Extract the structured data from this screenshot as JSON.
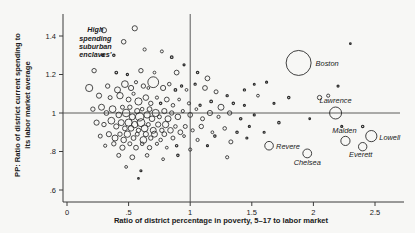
{
  "chart_data": {
    "type": "scatter",
    "title": "",
    "xlabel": "Ratio of district percentage in poverty, 5–17 to labor market",
    "ylabel": "PP: Ratio of district current spending to its labor market average",
    "xlim": [
      -0.05,
      2.75
    ],
    "ylim": [
      0.55,
      1.5
    ],
    "xticks": [
      0,
      0.5,
      1,
      1.5,
      2,
      2.5
    ],
    "xticklabels": [
      "0",
      ".5",
      "1",
      "1.5",
      "2",
      "2.5"
    ],
    "yticks": [
      0.6,
      0.8,
      1.0,
      1.2,
      1.4
    ],
    "yticklabels": [
      ".6",
      ".8",
      "1",
      "1.2",
      "1.4"
    ],
    "grid": false,
    "legend": null,
    "marker": "open-circle",
    "size_encoding": "district enrollment",
    "reference_lines": [
      {
        "type": "horizontal",
        "value": 1.0,
        "label": "y = 1"
      },
      {
        "type": "vertical",
        "value": 1.0,
        "label": "x = 1"
      }
    ],
    "annotations": [
      {
        "text": "High spending suburban enclaves'",
        "x": 0.23,
        "y": 1.42,
        "style": "italic"
      }
    ],
    "labeled_points": [
      {
        "name": "Boston",
        "x": 1.88,
        "y": 1.26,
        "r": 12.5
      },
      {
        "name": "Lawrence",
        "x": 2.18,
        "y": 1.0,
        "r": 6.0
      },
      {
        "name": "Malden",
        "x": 2.26,
        "y": 0.855,
        "r": 4.6
      },
      {
        "name": "Lowell",
        "x": 2.47,
        "y": 0.88,
        "r": 5.6
      },
      {
        "name": "Everett",
        "x": 2.4,
        "y": 0.825,
        "r": 4.2
      },
      {
        "name": "Revere",
        "x": 1.64,
        "y": 0.83,
        "r": 4.3
      },
      {
        "name": "Chelsea",
        "x": 1.95,
        "y": 0.79,
        "r": 4.4
      }
    ],
    "points": [
      {
        "x": 0.3,
        "y": 1.43,
        "r": 2.6
      },
      {
        "x": 0.55,
        "y": 1.44,
        "r": 2.6
      },
      {
        "x": 0.46,
        "y": 1.37,
        "r": 2.3
      },
      {
        "x": 0.63,
        "y": 1.33,
        "r": 1.6
      },
      {
        "x": 0.38,
        "y": 1.3,
        "r": 1.2
      },
      {
        "x": 0.29,
        "y": 1.3,
        "r": 1.2
      },
      {
        "x": 0.77,
        "y": 1.32,
        "r": 1.5
      },
      {
        "x": 0.85,
        "y": 1.29,
        "r": 1.3
      },
      {
        "x": 0.22,
        "y": 1.22,
        "r": 2.2
      },
      {
        "x": 0.4,
        "y": 1.21,
        "r": 1.3
      },
      {
        "x": 0.49,
        "y": 1.2,
        "r": 1.1
      },
      {
        "x": 0.6,
        "y": 1.22,
        "r": 2.2
      },
      {
        "x": 0.71,
        "y": 1.21,
        "r": 1.4
      },
      {
        "x": 0.89,
        "y": 1.21,
        "r": 2.4
      },
      {
        "x": 1.06,
        "y": 1.21,
        "r": 1.2
      },
      {
        "x": 0.95,
        "y": 1.25,
        "r": 1.0
      },
      {
        "x": 1.14,
        "y": 1.18,
        "r": 2.4
      },
      {
        "x": 0.18,
        "y": 1.13,
        "r": 3.6
      },
      {
        "x": 0.33,
        "y": 1.14,
        "r": 2.2
      },
      {
        "x": 0.41,
        "y": 1.12,
        "r": 3.0
      },
      {
        "x": 0.47,
        "y": 1.15,
        "r": 3.4
      },
      {
        "x": 0.52,
        "y": 1.13,
        "r": 2.6
      },
      {
        "x": 0.56,
        "y": 1.16,
        "r": 1.6
      },
      {
        "x": 0.62,
        "y": 1.14,
        "r": 2.2
      },
      {
        "x": 0.66,
        "y": 1.13,
        "r": 1.4
      },
      {
        "x": 0.7,
        "y": 1.16,
        "r": 5.4
      },
      {
        "x": 0.78,
        "y": 1.13,
        "r": 2.6
      },
      {
        "x": 0.83,
        "y": 1.15,
        "r": 1.8
      },
      {
        "x": 0.88,
        "y": 1.12,
        "r": 1.3
      },
      {
        "x": 0.93,
        "y": 1.14,
        "r": 1.1
      },
      {
        "x": 0.97,
        "y": 1.12,
        "r": 1.4
      },
      {
        "x": 1.04,
        "y": 1.15,
        "r": 1.1
      },
      {
        "x": 1.12,
        "y": 1.13,
        "r": 2.4
      },
      {
        "x": 1.21,
        "y": 1.11,
        "r": 2.0
      },
      {
        "x": 1.3,
        "y": 1.09,
        "r": 1.1
      },
      {
        "x": 0.26,
        "y": 1.09,
        "r": 2.6
      },
      {
        "x": 0.35,
        "y": 1.08,
        "r": 2.0
      },
      {
        "x": 0.43,
        "y": 1.09,
        "r": 3.2
      },
      {
        "x": 0.5,
        "y": 1.07,
        "r": 2.4
      },
      {
        "x": 0.54,
        "y": 1.1,
        "r": 1.6
      },
      {
        "x": 0.58,
        "y": 1.06,
        "r": 3.6
      },
      {
        "x": 0.64,
        "y": 1.08,
        "r": 2.8
      },
      {
        "x": 0.68,
        "y": 1.05,
        "r": 2.2
      },
      {
        "x": 0.73,
        "y": 1.08,
        "r": 1.6
      },
      {
        "x": 0.76,
        "y": 1.05,
        "r": 1.2
      },
      {
        "x": 0.81,
        "y": 1.07,
        "r": 2.4
      },
      {
        "x": 0.86,
        "y": 1.04,
        "r": 1.8
      },
      {
        "x": 0.91,
        "y": 1.07,
        "r": 1.4
      },
      {
        "x": 0.99,
        "y": 1.05,
        "r": 1.6
      },
      {
        "x": 1.08,
        "y": 1.04,
        "r": 1.1
      },
      {
        "x": 1.17,
        "y": 1.06,
        "r": 1.3
      },
      {
        "x": 1.25,
        "y": 1.03,
        "r": 3.0
      },
      {
        "x": 1.35,
        "y": 1.05,
        "r": 1.2
      },
      {
        "x": 1.44,
        "y": 1.04,
        "r": 1.0
      },
      {
        "x": 0.21,
        "y": 1.02,
        "r": 2.2
      },
      {
        "x": 0.28,
        "y": 1.03,
        "r": 3.0
      },
      {
        "x": 0.32,
        "y": 1.0,
        "r": 2.4
      },
      {
        "x": 0.37,
        "y": 1.02,
        "r": 3.4
      },
      {
        "x": 0.42,
        "y": 0.99,
        "r": 2.8
      },
      {
        "x": 0.45,
        "y": 1.03,
        "r": 2.0
      },
      {
        "x": 0.48,
        "y": 1.0,
        "r": 3.8
      },
      {
        "x": 0.51,
        "y": 1.03,
        "r": 2.2
      },
      {
        "x": 0.53,
        "y": 0.98,
        "r": 3.0
      },
      {
        "x": 0.57,
        "y": 1.01,
        "r": 2.6
      },
      {
        "x": 0.59,
        "y": 0.98,
        "r": 4.2
      },
      {
        "x": 0.61,
        "y": 1.02,
        "r": 1.8
      },
      {
        "x": 0.65,
        "y": 0.99,
        "r": 3.2
      },
      {
        "x": 0.67,
        "y": 1.02,
        "r": 2.4
      },
      {
        "x": 0.69,
        "y": 0.97,
        "r": 2.8
      },
      {
        "x": 0.72,
        "y": 1.0,
        "r": 3.6
      },
      {
        "x": 0.75,
        "y": 0.98,
        "r": 2.0
      },
      {
        "x": 0.79,
        "y": 1.01,
        "r": 2.6
      },
      {
        "x": 0.82,
        "y": 0.97,
        "r": 3.0
      },
      {
        "x": 0.85,
        "y": 1.0,
        "r": 2.2
      },
      {
        "x": 0.9,
        "y": 0.98,
        "r": 2.8
      },
      {
        "x": 0.94,
        "y": 1.01,
        "r": 1.6
      },
      {
        "x": 1.0,
        "y": 0.99,
        "r": 2.4
      },
      {
        "x": 1.05,
        "y": 1.02,
        "r": 1.4
      },
      {
        "x": 1.1,
        "y": 0.97,
        "r": 2.0
      },
      {
        "x": 1.16,
        "y": 1.0,
        "r": 2.6
      },
      {
        "x": 1.23,
        "y": 0.98,
        "r": 1.6
      },
      {
        "x": 1.32,
        "y": 1.0,
        "r": 2.2
      },
      {
        "x": 1.41,
        "y": 0.97,
        "r": 1.2
      },
      {
        "x": 1.52,
        "y": 0.99,
        "r": 1.0
      },
      {
        "x": 0.24,
        "y": 0.95,
        "r": 2.6
      },
      {
        "x": 0.3,
        "y": 0.94,
        "r": 2.2
      },
      {
        "x": 0.36,
        "y": 0.96,
        "r": 3.4
      },
      {
        "x": 0.4,
        "y": 0.93,
        "r": 2.6
      },
      {
        "x": 0.44,
        "y": 0.95,
        "r": 3.0
      },
      {
        "x": 0.47,
        "y": 0.92,
        "r": 2.4
      },
      {
        "x": 0.5,
        "y": 0.95,
        "r": 3.6
      },
      {
        "x": 0.52,
        "y": 0.92,
        "r": 2.8
      },
      {
        "x": 0.55,
        "y": 0.94,
        "r": 3.2
      },
      {
        "x": 0.58,
        "y": 0.91,
        "r": 2.2
      },
      {
        "x": 0.6,
        "y": 0.95,
        "r": 4.0
      },
      {
        "x": 0.63,
        "y": 0.92,
        "r": 3.4
      },
      {
        "x": 0.66,
        "y": 0.94,
        "r": 2.0
      },
      {
        "x": 0.7,
        "y": 0.91,
        "r": 3.0
      },
      {
        "x": 0.74,
        "y": 0.94,
        "r": 2.6
      },
      {
        "x": 0.77,
        "y": 0.91,
        "r": 2.2
      },
      {
        "x": 0.8,
        "y": 0.94,
        "r": 3.2
      },
      {
        "x": 0.84,
        "y": 0.91,
        "r": 2.8
      },
      {
        "x": 0.88,
        "y": 0.93,
        "r": 1.8
      },
      {
        "x": 0.92,
        "y": 0.9,
        "r": 2.4
      },
      {
        "x": 0.96,
        "y": 0.93,
        "r": 2.0
      },
      {
        "x": 1.02,
        "y": 0.91,
        "r": 1.6
      },
      {
        "x": 1.09,
        "y": 0.93,
        "r": 2.2
      },
      {
        "x": 1.18,
        "y": 0.9,
        "r": 1.4
      },
      {
        "x": 1.28,
        "y": 0.92,
        "r": 1.8
      },
      {
        "x": 1.38,
        "y": 0.9,
        "r": 1.2
      },
      {
        "x": 1.48,
        "y": 0.93,
        "r": 1.0
      },
      {
        "x": 0.27,
        "y": 0.88,
        "r": 2.0
      },
      {
        "x": 0.34,
        "y": 0.89,
        "r": 2.6
      },
      {
        "x": 0.39,
        "y": 0.87,
        "r": 3.0
      },
      {
        "x": 0.43,
        "y": 0.89,
        "r": 2.2
      },
      {
        "x": 0.46,
        "y": 0.86,
        "r": 2.8
      },
      {
        "x": 0.49,
        "y": 0.89,
        "r": 3.2
      },
      {
        "x": 0.54,
        "y": 0.87,
        "r": 2.4
      },
      {
        "x": 0.57,
        "y": 0.89,
        "r": 2.0
      },
      {
        "x": 0.62,
        "y": 0.86,
        "r": 3.4
      },
      {
        "x": 0.64,
        "y": 0.89,
        "r": 2.6
      },
      {
        "x": 0.68,
        "y": 0.87,
        "r": 2.2
      },
      {
        "x": 0.71,
        "y": 0.89,
        "r": 3.0
      },
      {
        "x": 0.76,
        "y": 0.86,
        "r": 1.8
      },
      {
        "x": 0.79,
        "y": 0.89,
        "r": 2.4
      },
      {
        "x": 0.86,
        "y": 0.87,
        "r": 2.0
      },
      {
        "x": 0.95,
        "y": 0.88,
        "r": 1.4
      },
      {
        "x": 1.06,
        "y": 0.86,
        "r": 1.6
      },
      {
        "x": 1.2,
        "y": 0.88,
        "r": 1.2
      },
      {
        "x": 1.33,
        "y": 0.85,
        "r": 2.0
      },
      {
        "x": 1.46,
        "y": 0.87,
        "r": 1.0
      },
      {
        "x": 0.31,
        "y": 0.83,
        "r": 1.6
      },
      {
        "x": 0.38,
        "y": 0.84,
        "r": 2.2
      },
      {
        "x": 0.45,
        "y": 0.82,
        "r": 2.6
      },
      {
        "x": 0.51,
        "y": 0.84,
        "r": 2.0
      },
      {
        "x": 0.56,
        "y": 0.82,
        "r": 2.4
      },
      {
        "x": 0.61,
        "y": 0.84,
        "r": 1.8
      },
      {
        "x": 0.67,
        "y": 0.82,
        "r": 2.2
      },
      {
        "x": 0.73,
        "y": 0.84,
        "r": 1.6
      },
      {
        "x": 0.81,
        "y": 0.82,
        "r": 1.4
      },
      {
        "x": 0.89,
        "y": 0.83,
        "r": 1.2
      },
      {
        "x": 1.0,
        "y": 0.81,
        "r": 1.6
      },
      {
        "x": 1.14,
        "y": 0.83,
        "r": 1.0
      },
      {
        "x": 0.42,
        "y": 0.78,
        "r": 2.0
      },
      {
        "x": 0.53,
        "y": 0.77,
        "r": 2.4
      },
      {
        "x": 0.65,
        "y": 0.78,
        "r": 1.8
      },
      {
        "x": 0.78,
        "y": 0.76,
        "r": 1.4
      },
      {
        "x": 0.9,
        "y": 0.78,
        "r": 1.2
      },
      {
        "x": 1.3,
        "y": 0.77,
        "r": 1.6
      },
      {
        "x": 0.48,
        "y": 0.72,
        "r": 1.4
      },
      {
        "x": 0.6,
        "y": 0.7,
        "r": 1.0
      },
      {
        "x": 0.58,
        "y": 0.66,
        "r": 0.8
      },
      {
        "x": 1.55,
        "y": 1.09,
        "r": 1.4
      },
      {
        "x": 1.68,
        "y": 1.05,
        "r": 1.0
      },
      {
        "x": 1.72,
        "y": 0.95,
        "r": 1.2
      },
      {
        "x": 1.6,
        "y": 0.9,
        "r": 1.0
      },
      {
        "x": 2.05,
        "y": 1.08,
        "r": 2.2
      },
      {
        "x": 2.12,
        "y": 1.09,
        "r": 1.6
      },
      {
        "x": 1.8,
        "y": 1.08,
        "r": 1.2
      },
      {
        "x": 1.52,
        "y": 1.15,
        "r": 0.9
      },
      {
        "x": 2.3,
        "y": 1.36,
        "r": 0.8
      },
      {
        "x": 1.97,
        "y": 0.97,
        "r": 0.8
      },
      {
        "x": 2.23,
        "y": 0.93,
        "r": 1.0
      },
      {
        "x": 2.4,
        "y": 0.93,
        "r": 1.2
      },
      {
        "x": 2.2,
        "y": 1.14,
        "r": 1.0
      },
      {
        "x": 1.44,
        "y": 1.12,
        "r": 1.1
      },
      {
        "x": 1.62,
        "y": 1.16,
        "r": 1.0
      }
    ]
  },
  "figure": {
    "y_axis_label": "PP: Ratio of district current spending to its labor market average",
    "x_axis_label": "Ratio of district percentage in poverty, 5–17 to labor market",
    "annotation": "High spending suburban enclaves'",
    "x_tick_labels": [
      "0",
      ".5",
      "1",
      "1.5",
      "2",
      "2.5"
    ],
    "y_tick_labels": [
      "1.4",
      "1.2",
      "1",
      ".8",
      ".6"
    ],
    "city_labels": [
      "Boston",
      "Lawrence",
      "Malden",
      "Lowell",
      "Everett",
      "Revere",
      "Chelsea"
    ],
    "colors": {
      "background": "#f7f7f5",
      "marker_stroke": "#2b2b2b",
      "axis": "#3a3a3a",
      "text": "#1a1a1a"
    }
  }
}
